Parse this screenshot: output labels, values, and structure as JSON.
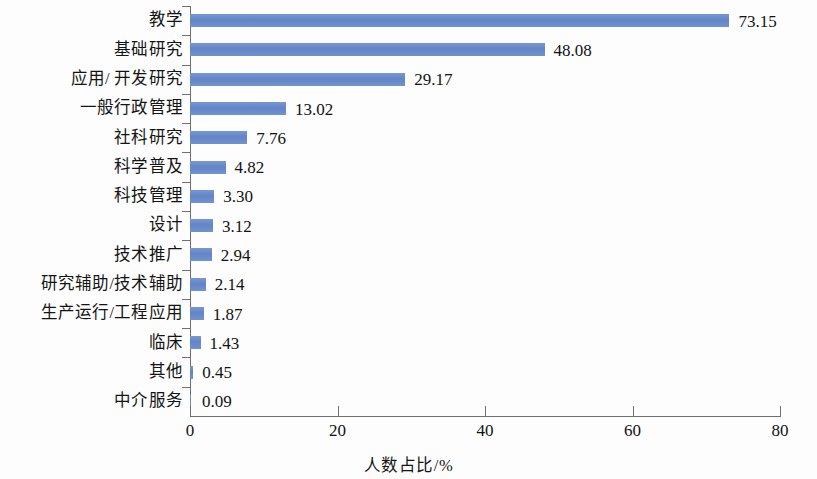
{
  "chart_data": {
    "type": "bar",
    "orientation": "horizontal",
    "title": "",
    "xlabel": "人数占比/%",
    "ylabel": "",
    "xlim": [
      0,
      80
    ],
    "xticks": [
      0,
      20,
      40,
      60,
      80
    ],
    "grid": false,
    "legend": false,
    "bar_color": "#6384c6",
    "axis_color": "#6f6f6f",
    "categories": [
      "教学",
      "基础研究",
      "应用/ 开发研究",
      "一般行政管理",
      "社科研究",
      "科学普及",
      "科技管理",
      "设计",
      "技术推广",
      "研究辅助/技术辅助",
      "生产运行/工程应用",
      "临床",
      "其他",
      "中介服务"
    ],
    "values": [
      73.15,
      48.08,
      29.17,
      13.02,
      7.76,
      4.82,
      3.3,
      3.12,
      2.94,
      2.14,
      1.87,
      1.43,
      0.45,
      0.09
    ],
    "value_labels": [
      "73.15",
      "48.08",
      "29.17",
      "13.02",
      "7.76",
      "4.82",
      "3.30",
      "3.12",
      "2.94",
      "2.14",
      "1.87",
      "1.43",
      "0.45",
      "0.09"
    ]
  }
}
